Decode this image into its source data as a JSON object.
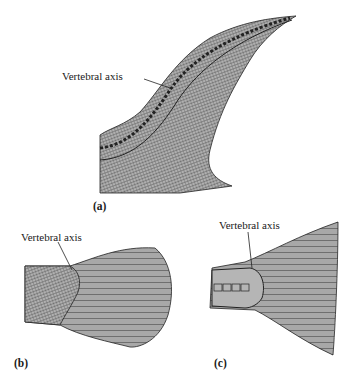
{
  "figure": {
    "panels": [
      {
        "id": "a",
        "label": "(a)",
        "callout": "Vertebral axis"
      },
      {
        "id": "b",
        "label": "(b)",
        "callout": "Vertebral axis"
      },
      {
        "id": "c",
        "label": "(c)",
        "callout": "Vertebral axis"
      }
    ]
  },
  "colors": {
    "fill": "#9a9a9a",
    "ink": "#222222",
    "background": "#ffffff"
  }
}
